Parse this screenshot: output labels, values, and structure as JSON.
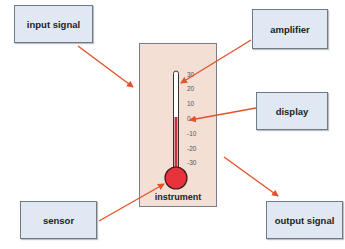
{
  "diagram": {
    "title": "",
    "boxes": {
      "input_signal": "input signal",
      "amplifier": "amplifier",
      "display": "display",
      "sensor": "sensor",
      "output_signal": "output signal"
    },
    "instrument": {
      "label": "instrument",
      "scale_ticks": [
        "30",
        "20",
        "10",
        "0",
        "-10",
        "-20",
        "-30"
      ],
      "reading": "0"
    },
    "colors": {
      "box_fill": "#dfe8f3",
      "panel_fill": "#f3dfd4",
      "arrow": "#e2532a",
      "mercury": "#c8323c",
      "bulb": "#e8323c"
    },
    "arrows": [
      {
        "from": "input signal",
        "to": "instrument"
      },
      {
        "from": "amplifier",
        "to": "thermometer tube"
      },
      {
        "from": "display",
        "to": "scale 0"
      },
      {
        "from": "sensor",
        "to": "bulb"
      },
      {
        "from": "instrument",
        "to": "output signal"
      }
    ]
  }
}
